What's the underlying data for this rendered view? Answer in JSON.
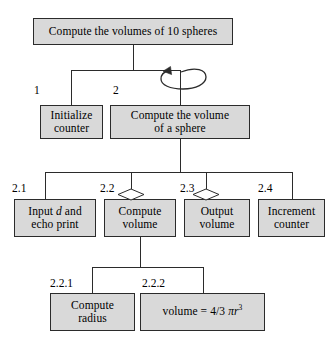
{
  "diagram": {
    "type": "structure-chart",
    "title_box": {
      "label": "Compute the volumes of 10 spheres"
    },
    "level2": [
      {
        "step": "1",
        "label": "Initialize\ncounter",
        "has_loop": false
      },
      {
        "step": "2",
        "label": "Compute the volume\nof a sphere",
        "has_loop": true
      }
    ],
    "level3": [
      {
        "step": "2.1",
        "label_pre": "Input ",
        "label_italic": "d",
        "label_post": " and\necho print",
        "has_diamond": false
      },
      {
        "step": "2.2",
        "label": "Compute\nvolume",
        "has_diamond": true
      },
      {
        "step": "2.3",
        "label": "Output\nvolume",
        "has_diamond": true
      },
      {
        "step": "2.4",
        "label": "Increment\ncounter",
        "has_diamond": false
      }
    ],
    "level4": [
      {
        "step": "2.2.1",
        "label": "Compute\nradius",
        "is_formula": false
      },
      {
        "step": "2.2.2",
        "formula_lhs": "volume = 4/3 ",
        "formula_pi": "π",
        "formula_var": "r",
        "formula_exp": "3",
        "is_formula": true
      }
    ],
    "colors": {
      "box_fill": "#d9d9d9",
      "box_border": "#2b2b2b",
      "line": "#2b2b2b",
      "text": "#000000",
      "background": "#ffffff"
    }
  }
}
